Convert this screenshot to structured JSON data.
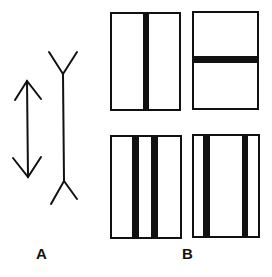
{
  "figure": {
    "panel_a": {
      "label": "A",
      "description": "Müller-Lyer illusion: line with inward arrowheads vs line with outward fins"
    },
    "panel_b": {
      "label": "B",
      "boxes": [
        {
          "id": "top-left",
          "bars": "single vertical bar, centered"
        },
        {
          "id": "top-right",
          "bars": "single horizontal bar, centered"
        },
        {
          "id": "bottom-left",
          "bars": "two vertical bars, close together near center"
        },
        {
          "id": "bottom-right",
          "bars": "two vertical bars, near left and right edges"
        }
      ]
    },
    "colors": {
      "ink": "#111111",
      "background": "#ffffff"
    }
  }
}
